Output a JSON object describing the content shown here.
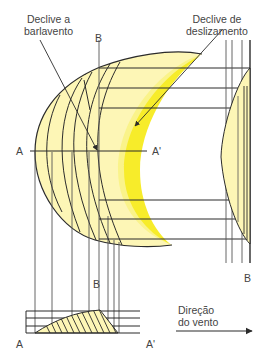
{
  "figure": {
    "type": "dune-cross-section-diagram",
    "colors": {
      "dune_fill": "#fdf6b6",
      "slip_face_band": "#f7ec2a",
      "slip_face_glow": "#faf38a",
      "line": "#2b2b2b",
      "grid_line": "#555555",
      "label_text": "#444444"
    }
  },
  "labels": {
    "windward_slope": [
      "Declive a",
      "barlavento"
    ],
    "slip_face": [
      "Declive de",
      "deslizamento"
    ],
    "section_a_left_mid": "A",
    "section_a_right_mid": "A'",
    "section_b_top": "B",
    "section_b_mid": "B",
    "section_b_right_bottom": "B",
    "section_a_left_bottom": "A",
    "section_a_right_bottom": "A'",
    "wind_direction": [
      "Direção",
      "do vento"
    ]
  },
  "annotations": {
    "wind_arrow": "right-arrow",
    "windward_pointer": "arrow to windward slope",
    "slip_face_pointer": "arrow to slip face"
  }
}
